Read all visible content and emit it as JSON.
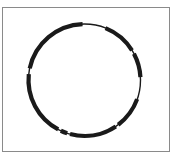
{
  "diagram": {
    "type": "circular-map",
    "colors": {
      "ring": "#1a1a1a",
      "frame": "#8a8a8a",
      "background": "#ffffff"
    },
    "ring": {
      "cx": 84.5,
      "cy": 80,
      "r": 56,
      "backbone_width": 1.4,
      "feature_width": 4.2
    },
    "features": [
      {
        "name": "segment-a",
        "start_deg": 282,
        "end_deg": 358
      },
      {
        "name": "segment-b",
        "start_deg": 22,
        "end_deg": 58
      },
      {
        "name": "segment-c",
        "start_deg": 62,
        "end_deg": 87
      },
      {
        "name": "segment-d",
        "start_deg": 110,
        "end_deg": 143
      },
      {
        "name": "segment-e",
        "start_deg": 146,
        "end_deg": 195
      },
      {
        "name": "segment-f",
        "start_deg": 198,
        "end_deg": 205
      },
      {
        "name": "segment-g",
        "start_deg": 208,
        "end_deg": 276
      }
    ]
  }
}
